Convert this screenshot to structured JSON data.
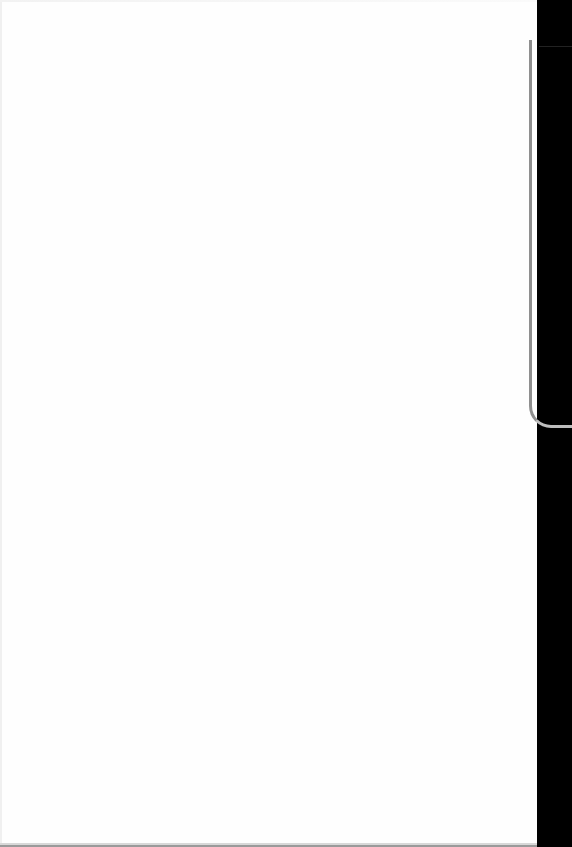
{
  "scene": {
    "description": "Photograph of a blank white sheet of paper against a black background",
    "paper_color": "#fefefe",
    "background_color": "#000000",
    "edge_color": "#8f8f8f",
    "text_content": []
  }
}
